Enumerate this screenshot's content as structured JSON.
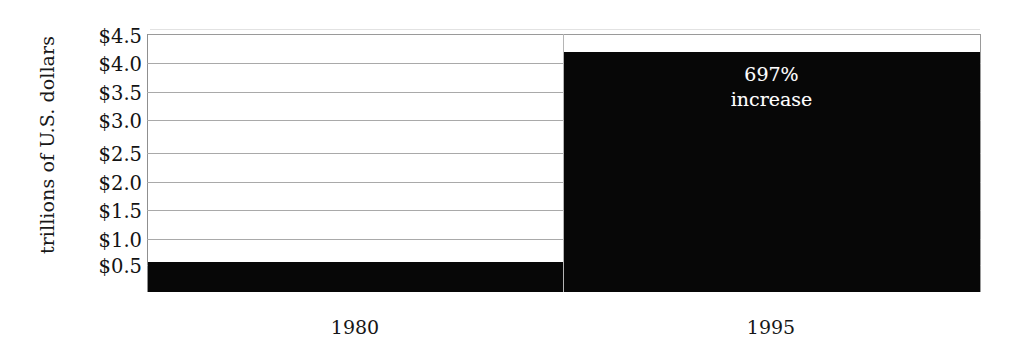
{
  "chart_data": {
    "type": "bar",
    "title": "",
    "subtitle": "",
    "xlabel": "",
    "ylabel": "trillions of U.S. dollars",
    "categories": [
      "1980",
      "1995"
    ],
    "values": [
      0.53,
      4.18
    ],
    "value_labels": [
      "",
      ""
    ],
    "ylim": [
      0,
      4.5
    ],
    "ytick_values": [
      4.5,
      4.0,
      3.5,
      3.0,
      2.5,
      2.0,
      1.5,
      1.0,
      0.5
    ],
    "ytick_labels": [
      "$4.5",
      "$4.0",
      "$3.5",
      "$3.0",
      "$2.5",
      "$2.0",
      "$1.5",
      "$1.0",
      "$0.5"
    ],
    "grid": true,
    "grid_axis": "y",
    "legend": false,
    "legend_position": "none",
    "bar_color": "#070707",
    "gridline_color": "#a9a9a9",
    "background_color": "#ffffff",
    "annotations": [
      {
        "name": "increase-callout",
        "lines": [
          "697%",
          "increase"
        ],
        "attached_to_category": "1995",
        "text_color": "#ffffff"
      }
    ]
  }
}
